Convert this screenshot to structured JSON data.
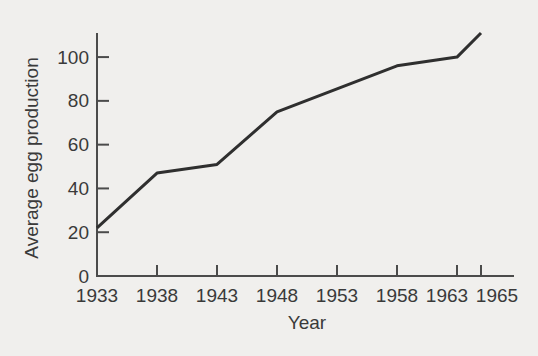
{
  "figure": {
    "background": "#f0efed",
    "text_color": "#3a3a3a",
    "axis_color": "#4b4b4b"
  },
  "chart_data": {
    "type": "line",
    "title": "",
    "xlabel": "Year",
    "ylabel": "Average egg production",
    "x": [
      1933,
      1938,
      1943,
      1948,
      1958,
      1963,
      1965
    ],
    "values": [
      22,
      47,
      51,
      75,
      96,
      100,
      111
    ],
    "x_ticks": [
      1933,
      1938,
      1943,
      1948,
      1953,
      1958,
      1963,
      1965
    ],
    "x_tick_labels": [
      "1933",
      "1938",
      "1943",
      "1948",
      "1953",
      "1958",
      "1963",
      "1965"
    ],
    "y_ticks": [
      0,
      20,
      40,
      60,
      80,
      100
    ],
    "xlim": [
      1933,
      1967.8
    ],
    "ylim": [
      0,
      111
    ],
    "grid": false,
    "legend": "none",
    "line_color": "#2f2f2f",
    "x_tick_label_offsets": {
      "1963": -10,
      "1965": 16
    }
  }
}
